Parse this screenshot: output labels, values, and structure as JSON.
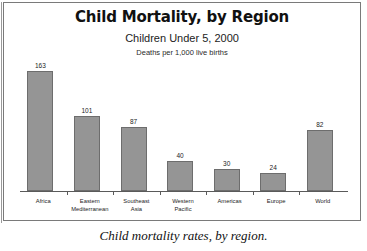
{
  "chart_data": {
    "type": "bar",
    "title": "Child Mortality, by Region",
    "subtitle": "Children Under 5, 2000",
    "subtitle2": "Deaths per 1,000 live births",
    "xlabel": "",
    "ylabel": "Deaths per 1,000 live births",
    "ylim": [
      0,
      180
    ],
    "grid": false,
    "legend": "none",
    "categories": [
      "Africa",
      "Eastern Mediterranean",
      "Southeast Asia",
      "Western Pacific",
      "Americas",
      "Europe",
      "World"
    ],
    "values": [
      163,
      101,
      87,
      40,
      30,
      24,
      82
    ],
    "bar_color": "#959595",
    "bar_border_color": "#6d6d6d"
  },
  "caption": "Child mortality rates, by region.",
  "colors": {
    "background": "#ffffff",
    "frame": "#7a7a7a",
    "axis": "#5a5a5a",
    "text": "#111111"
  }
}
